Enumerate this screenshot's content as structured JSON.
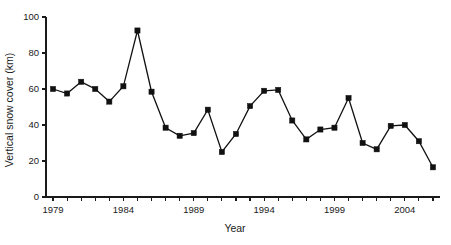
{
  "chart_data": {
    "type": "line",
    "title": "",
    "subtitle": "",
    "xlabel": "Year",
    "ylabel": "Vertical snow cover (km)",
    "xlim": [
      1978.5,
      2006.5
    ],
    "ylim": [
      0,
      100
    ],
    "grid": false,
    "legend": null,
    "marker": "square",
    "line_color": "#111111",
    "marker_color": "#111111",
    "y_ticks": [
      0,
      20,
      40,
      60,
      80,
      100
    ],
    "y_tick_labels": [
      "0",
      "20",
      "40",
      "60",
      "80",
      "100"
    ],
    "x_ticks": [
      1979,
      1980,
      1981,
      1982,
      1983,
      1984,
      1985,
      1986,
      1987,
      1988,
      1989,
      1990,
      1991,
      1992,
      1993,
      1994,
      1995,
      1996,
      1997,
      1998,
      1999,
      2000,
      2001,
      2002,
      2003,
      2004,
      2005,
      2006
    ],
    "x_tick_labels": [
      "1979",
      "",
      "",
      "",
      "",
      "1984",
      "",
      "",
      "",
      "",
      "1989",
      "",
      "",
      "",
      "",
      "1994",
      "",
      "",
      "",
      "",
      "1999",
      "",
      "",
      "",
      "",
      "2004",
      "",
      ""
    ],
    "x": [
      1979,
      1980,
      1981,
      1982,
      1983,
      1984,
      1985,
      1986,
      1987,
      1988,
      1989,
      1990,
      1991,
      1992,
      1993,
      1994,
      1995,
      1996,
      1997,
      1998,
      1999,
      2000,
      2001,
      2002,
      2003,
      2004,
      2005,
      2006
    ],
    "values": [
      60,
      57.5,
      64,
      60,
      53,
      61.5,
      92.5,
      58.5,
      38.5,
      34,
      35.5,
      48.5,
      25,
      35,
      50.5,
      59,
      59.5,
      42.5,
      32,
      37.5,
      38.5,
      55,
      30,
      26.5,
      39.5,
      40,
      31,
      16.5
    ]
  },
  "axes": {
    "ylabel": "Vertical snow cover (km)",
    "xlabel": "Year"
  }
}
